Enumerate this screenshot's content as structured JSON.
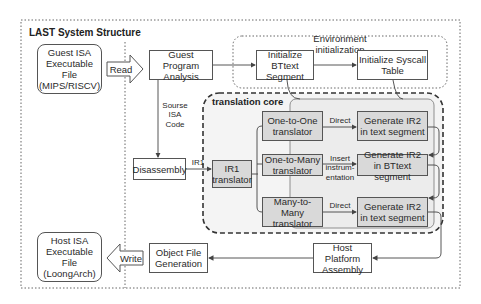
{
  "diagram": {
    "title": "LAST System Structure",
    "groups": {
      "environment_init": "Environment initialization",
      "translation_core": "translation core"
    },
    "nodes": {
      "guest_file": "Guest ISA\nExecutable File\n(MIPS/RISCV)",
      "guest_analysis": "Guest Program\nAnalysis",
      "init_bttext": "Initialize BTtext\nSegment",
      "init_syscall": "Initialize Syscall\nTable",
      "disassembly": "Disassembly",
      "ir1_translator": "IR1\ntranslator",
      "one_to_one": "One-to-One\ntranslator",
      "one_to_many": "One-to-Many\ntranslator",
      "many_to_many": "Many-to-Many\ntranslator",
      "gen_ir2_text_1": "Generate IR2\nin text segment",
      "gen_ir2_bttext": "Generate IR2\nin BTtext segment",
      "gen_ir2_text_2": "Generate IR2\nin text segment",
      "host_assembly": "Host Platform\nAssembly",
      "object_gen": "Object File\nGeneration",
      "host_file": "Host ISA\nExecutable File\n(LoongArch)"
    },
    "edge_labels": {
      "read": "Read",
      "write": "Write",
      "source_isa_code": "Sourse\nISA\nCode",
      "ir1": "IR1",
      "direct_1": "Direct",
      "insert_instrumentation": "Insert\ninstrum-\nentation",
      "direct_2": "Direct"
    },
    "colors": {
      "line": "#555555",
      "translator_fill": "#d9d9d9",
      "core_fill": "#ededed",
      "background": "#ffffff"
    }
  }
}
